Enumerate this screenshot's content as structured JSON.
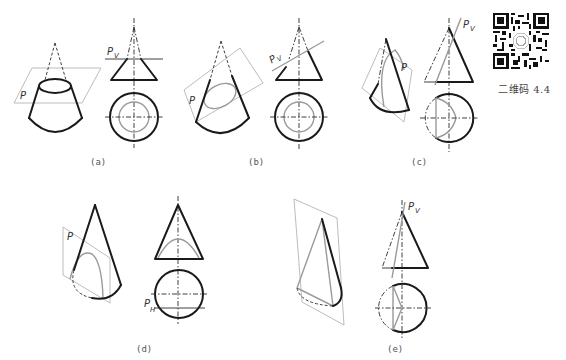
{
  "figure": {
    "panels": [
      {
        "id": "a",
        "caption": "(a)",
        "plane_label": "P",
        "trace_label": "P",
        "trace_sub": "V",
        "description": "plane perpendicular to axis — circle"
      },
      {
        "id": "b",
        "caption": "(b)",
        "plane_label": "P",
        "trace_label": "P",
        "trace_sub": "V",
        "description": "plane inclined to axis — ellipse"
      },
      {
        "id": "c",
        "caption": "(c)",
        "plane_label": "P",
        "trace_label": "P",
        "trace_sub": "V",
        "description": "plane parallel to one element — parabola"
      },
      {
        "id": "d",
        "caption": "(d)",
        "plane_label": "P",
        "trace_label": "P",
        "trace_sub": "H",
        "description": "plane parallel to axis — hyperbola"
      },
      {
        "id": "e",
        "caption": "(e)",
        "plane_label": "",
        "trace_label": "P",
        "trace_sub": "V",
        "description": "plane through apex — triangle"
      }
    ]
  },
  "qr": {
    "caption": "二维码 4.4",
    "icon": "qr-code-icon"
  },
  "colors": {
    "line": "#1a1a1a",
    "section": "#9a9a9a",
    "plane": "#b4b4b4",
    "background": "#ffffff"
  }
}
